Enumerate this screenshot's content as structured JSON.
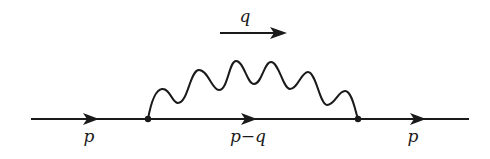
{
  "diagram": {
    "type": "feynman-diagram",
    "colors": {
      "line": "#1a1a1a",
      "background": "#ffffff"
    },
    "labels": {
      "photon_momentum": "q",
      "incoming": "p",
      "internal": "p−q",
      "outgoing": "p"
    },
    "vertices": [
      {
        "id": "v1",
        "x": 148,
        "y": 119
      },
      {
        "id": "v2",
        "x": 358,
        "y": 119
      }
    ],
    "edges": [
      {
        "from": "in",
        "to": "v1",
        "kind": "fermion",
        "label": "p"
      },
      {
        "from": "v1",
        "to": "v2",
        "kind": "fermion",
        "label": "p−q"
      },
      {
        "from": "v2",
        "to": "out",
        "kind": "fermion",
        "label": "p"
      },
      {
        "from": "v1",
        "to": "v2",
        "kind": "photon",
        "label": "q"
      }
    ]
  }
}
